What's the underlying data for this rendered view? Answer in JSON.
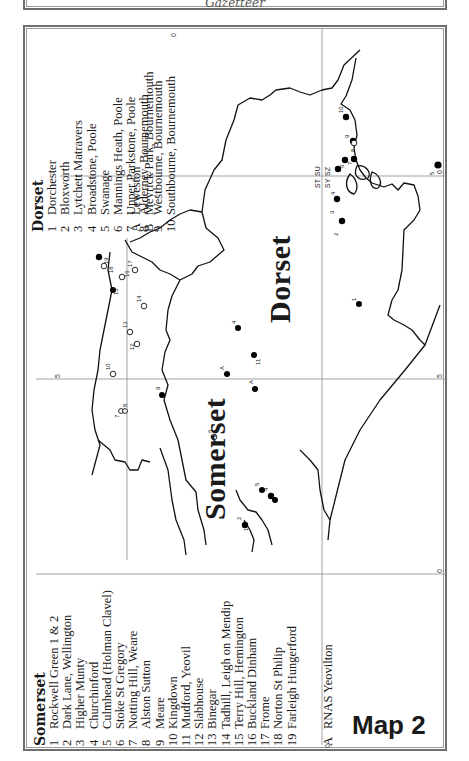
{
  "header_fragment": {
    "caption": "Gazetteer"
  },
  "map_title": "Map 2",
  "counties": {
    "somerset": {
      "label": "Somerset",
      "legend_title": "Somerset",
      "items": [
        {
          "n": "1",
          "name": "Rockwell Green 1 & 2"
        },
        {
          "n": "2",
          "name": "Dark Lane, Wellington"
        },
        {
          "n": "3",
          "name": "Higher Munty"
        },
        {
          "n": "4",
          "name": "Churchinford"
        },
        {
          "n": "5",
          "name": "Culmhead (Holman Clavel)"
        },
        {
          "n": "6",
          "name": "Stoke St Gregory"
        },
        {
          "n": "7",
          "name": "Notting Hill, Weare"
        },
        {
          "n": "8",
          "name": "Alston Sutton"
        },
        {
          "n": "9",
          "name": "Meare"
        },
        {
          "n": "10",
          "name": "Kingdown"
        },
        {
          "n": "11",
          "name": "Mudford, Yeovil"
        },
        {
          "n": "12",
          "name": "Slabhouse"
        },
        {
          "n": "13",
          "name": "Binegar"
        },
        {
          "n": "14",
          "name": "Tadhill, Leigh on Mendip"
        },
        {
          "n": "15",
          "name": "Terry Hill, Hemington"
        },
        {
          "n": "16",
          "name": "Buckland Dinham"
        },
        {
          "n": "17",
          "name": "Frome"
        },
        {
          "n": "18",
          "name": "Norton St Philip"
        },
        {
          "n": "19",
          "name": "Farleigh Hungerford"
        }
      ],
      "extra": [
        {
          "n": "A",
          "name": "RNAS Yeovilton"
        }
      ]
    },
    "dorset": {
      "label": "Dorset",
      "legend_title": "Dorset",
      "items": [
        {
          "n": "1",
          "name": "Dorchester"
        },
        {
          "n": "2",
          "name": "Bloxworth"
        },
        {
          "n": "3",
          "name": "Lytchett Matravers"
        },
        {
          "n": "4",
          "name": "Broadstone, Poole"
        },
        {
          "n": "5",
          "name": "Swanage"
        },
        {
          "n": "6",
          "name": "Mannings Heath, Poole"
        },
        {
          "n": "7",
          "name": "Upper Parkstone, Poole"
        },
        {
          "n": "8",
          "name": "Alderney, Bournemouth"
        },
        {
          "n": "9",
          "name": "Westbourne, Bournemouth"
        },
        {
          "n": "10",
          "name": "Southbourne, Bournemouth"
        }
      ],
      "extra": [
        {
          "n": "A",
          "name": "Leweston"
        },
        {
          "n": "B",
          "name": "Meyrick Park, Bournemouth"
        }
      ]
    }
  },
  "grid": {
    "labels": [
      {
        "text": "0",
        "pos": "top-vertical"
      },
      {
        "text": "0",
        "pos": "right-upper"
      },
      {
        "text": "5",
        "pos": "right-lower"
      },
      {
        "text": "5",
        "pos": "left-horizontal"
      },
      {
        "text": "0",
        "pos": "right-bottom"
      },
      {
        "text": "0",
        "pos": "bottom-vertical"
      }
    ],
    "square_labels": [
      "ST",
      "SU",
      "SY",
      "SZ"
    ]
  },
  "sites": {
    "somerset_filled": [
      "1",
      "2",
      "3",
      "4",
      "5",
      "9",
      "11",
      "15",
      "19"
    ],
    "somerset_open": [
      "6",
      "7",
      "8",
      "10",
      "12",
      "13",
      "14",
      "16",
      "17",
      "18"
    ],
    "dorset_filled": [
      "1",
      "2",
      "3",
      "4",
      "5",
      "6",
      "7",
      "9",
      "10"
    ],
    "dorset_open": [
      "8"
    ]
  }
}
